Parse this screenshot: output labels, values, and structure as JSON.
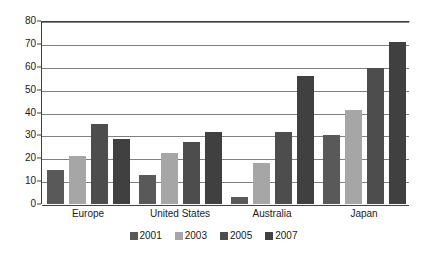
{
  "chart_data": {
    "type": "bar",
    "title": "",
    "subtitle": "",
    "xlabel": "",
    "ylabel": "",
    "categories": [
      "Europe",
      "United States",
      "Australia",
      "Japan"
    ],
    "series": [
      {
        "name": "2001",
        "color": "#595959",
        "values": [
          15,
          12.5,
          3,
          30
        ]
      },
      {
        "name": "2003",
        "color": "#a6a6a6",
        "values": [
          21,
          22.5,
          18,
          41
        ]
      },
      {
        "name": "2005",
        "color": "#4d4d4d",
        "values": [
          35,
          27,
          31.5,
          59.5
        ]
      },
      {
        "name": "2007",
        "color": "#404040",
        "values": [
          28.5,
          31.5,
          56,
          71
        ]
      }
    ],
    "ylim": [
      0,
      80
    ],
    "ytick_step": 10,
    "yticks": [
      "0",
      "10",
      "20",
      "30",
      "40",
      "50",
      "60",
      "70",
      "80"
    ],
    "grid": true,
    "grid_axis": "y",
    "legend_position": "bottom-center",
    "legend_orientation": "horizontal",
    "bar_orientation": "vertical",
    "grouping": "clustered",
    "plot_background": "#ffffff",
    "gridline_color": "#808080",
    "axis_color": "#3f3f3f",
    "text_color": "#1a1a1a"
  }
}
